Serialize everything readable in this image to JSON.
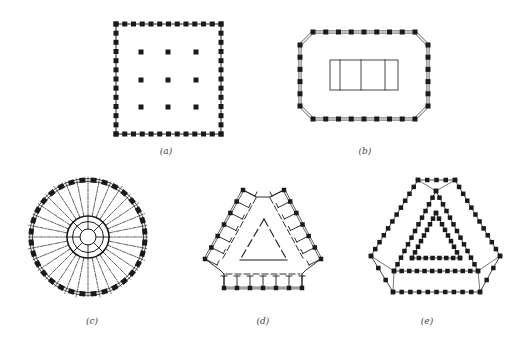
{
  "figure": {
    "panels": [
      {
        "id": "a",
        "caption": "(a)",
        "description": "Square plan with perimeter columns and 3x3 interior columns",
        "caption_pos": [
          166,
          152
        ]
      },
      {
        "id": "b",
        "caption": "(b)",
        "description": "Chamfered rectangular plan with perimeter columns and central core",
        "caption_pos": [
          365,
          152
        ]
      },
      {
        "id": "c",
        "caption": "(c)",
        "description": "Circular plan with radial framing and central cylindrical core",
        "caption_pos": [
          92,
          322
        ]
      },
      {
        "id": "d",
        "caption": "(d)",
        "description": "Triangular plan with three wings and central triangular atrium",
        "caption_pos": [
          263,
          322
        ]
      },
      {
        "id": "e",
        "caption": "(e)",
        "description": "Triangular plan with nested tube frames",
        "caption_pos": [
          427,
          322
        ]
      }
    ]
  },
  "colors": {
    "ink": "#1a1a1a",
    "paper": "#ffffff",
    "caption": "#444444"
  }
}
